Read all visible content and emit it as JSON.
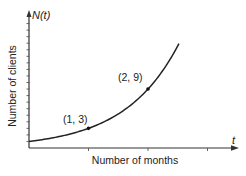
{
  "chart_data": {
    "type": "line",
    "title": "",
    "xlabel": "Number of months",
    "ylabel": "Number of clients",
    "x_variable": "t",
    "y_variable": "N(t)",
    "function": "N(t) = 3^t",
    "xlim": [
      0,
      3.4
    ],
    "ylim": [
      0,
      20
    ],
    "x_ticks": [
      1,
      2,
      3
    ],
    "y_tick_step": 1,
    "grid": false,
    "legend": null,
    "series": [
      {
        "name": "N(t)",
        "x": [
          0,
          0.5,
          1,
          1.5,
          2,
          2.3,
          2.52
        ],
        "values": [
          1,
          1.73,
          3,
          5.2,
          9,
          12.5,
          15.9
        ]
      }
    ],
    "annotations": [
      {
        "label": "(1, 3)",
        "x": 1,
        "y": 3
      },
      {
        "label": "(2, 9)",
        "x": 2,
        "y": 9
      }
    ]
  },
  "labels": {
    "y_axis_var": "N(t)",
    "x_axis_var": "t",
    "y_axis_title": "Number of clients",
    "x_axis_title": "Number of months",
    "point1": "(1, 3)",
    "point2": "(2, 9)"
  }
}
